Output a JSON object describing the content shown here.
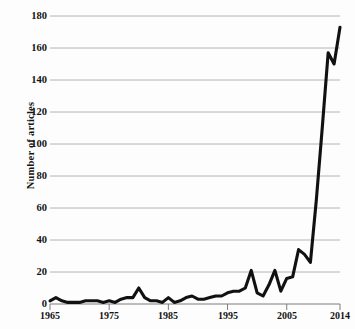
{
  "chart": {
    "type": "line",
    "ylabel": "Number of articles",
    "xlabel": ""
  },
  "axis": {
    "y_ticks": [
      "0",
      "20",
      "40",
      "60",
      "80",
      "100",
      "120",
      "140",
      "160",
      "180"
    ],
    "x_ticks": [
      "1965",
      "1975",
      "1985",
      "1995",
      "2005",
      "2014"
    ]
  },
  "colors": {
    "line": "#111111",
    "grid": "#b4b4b4",
    "axis": "#7d7d7d",
    "text": "#141414",
    "background": "#fdfdfd"
  },
  "chart_data": {
    "type": "line",
    "title": "",
    "xlabel": "",
    "ylabel": "Number of articles",
    "xlim": [
      1965,
      2014
    ],
    "ylim": [
      0,
      180
    ],
    "grid": true,
    "legend": false,
    "xticks": [
      1965,
      1975,
      1985,
      1995,
      2005,
      2014
    ],
    "yticks": [
      0,
      20,
      40,
      60,
      80,
      100,
      120,
      140,
      160,
      180
    ],
    "series": [
      {
        "name": "Number of articles",
        "x": [
          1965,
          1966,
          1967,
          1968,
          1969,
          1970,
          1971,
          1972,
          1973,
          1974,
          1975,
          1976,
          1977,
          1978,
          1979,
          1980,
          1981,
          1982,
          1983,
          1984,
          1985,
          1986,
          1987,
          1988,
          1989,
          1990,
          1991,
          1992,
          1993,
          1994,
          1995,
          1996,
          1997,
          1998,
          1999,
          2000,
          2001,
          2002,
          2003,
          2004,
          2005,
          2006,
          2007,
          2008,
          2009,
          2010,
          2011,
          2012,
          2013,
          2014
        ],
        "values": [
          2,
          4,
          2,
          1,
          1,
          1,
          2,
          2,
          2,
          1,
          2,
          1,
          3,
          4,
          4,
          10,
          4,
          2,
          2,
          1,
          4,
          1,
          2,
          4,
          5,
          3,
          3,
          4,
          5,
          5,
          7,
          8,
          8,
          10,
          21,
          7,
          5,
          12,
          21,
          8,
          16,
          17,
          34,
          31,
          26,
          65,
          110,
          157,
          150,
          173
        ]
      }
    ]
  }
}
